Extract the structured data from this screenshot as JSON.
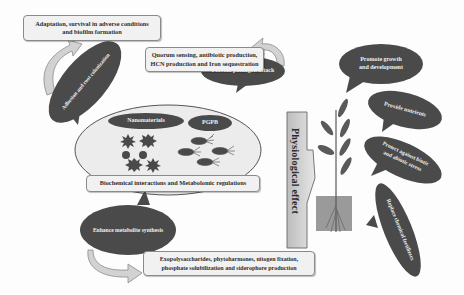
{
  "diagram": {
    "top_left_box": {
      "line1": "Adaptation, survival in adverse conditions",
      "line2": "and biofilm formation"
    },
    "adhesion_bubble": "Adhesion and root colonization",
    "quorum_box": {
      "line1": "Quorum sensing, antibiotic production,",
      "line2": "HCN production and Iron sequestration"
    },
    "prevent_bubble": "Prevent pathogen attack",
    "center_ellipse": {
      "nanomaterials_label": "Nanomaterials",
      "pgpb_label": "PGPB"
    },
    "biochem_box": "Biochemical interactions and Metabolomic regulations",
    "enhance_bubble": "Enhance metabolite synthesis",
    "bottom_box": {
      "line1": "Exopolysaccharides, phytoharmones,  nitogen fixation,",
      "line2": "phosphate solubilization and siderophore production"
    },
    "physiological_arrow": "Physiological effect",
    "right_bubbles": [
      {
        "line1": "Promote growth",
        "line2": "and development"
      },
      {
        "line1": "Provide nutrients",
        "line2": ""
      },
      {
        "line1": "Protect against biotic",
        "line2": "and abiotic stress"
      },
      {
        "line1": "Replace chemical fertilizers",
        "line2": ""
      }
    ],
    "colors": {
      "bubble_dark": "#4a4a4a",
      "box_fill": "#f1f1f1",
      "arrow_fill": "#d6d6d6",
      "ellipse_fill": "#ececec",
      "soil": "#9a9a9a",
      "plant": "#5a5a5a"
    }
  }
}
